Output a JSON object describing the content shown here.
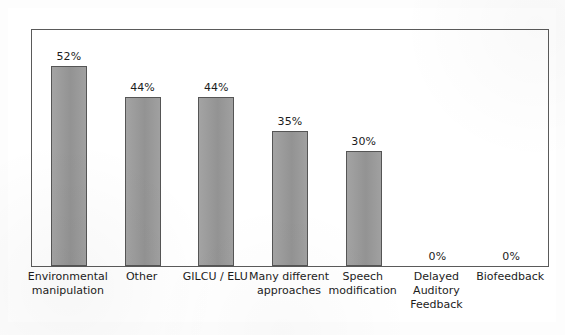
{
  "chart_data": {
    "type": "bar",
    "title": "",
    "subtitle": "",
    "xlabel": "",
    "ylabel": "",
    "ylim": [
      0,
      60
    ],
    "grid": false,
    "legend": "none",
    "orientation": "vertical",
    "value_label_format": "percent",
    "categories": [
      "Environmental manipulation",
      "Other",
      "GILCU / ELU",
      "Many different approaches",
      "Speech modification",
      "Delayed Auditory Feedback",
      "Biofeedback"
    ],
    "values": [
      52,
      44,
      44,
      35,
      30,
      0,
      0
    ],
    "value_labels": [
      "52%",
      "44%",
      "44%",
      "35%",
      "30%",
      "0%",
      "0%"
    ],
    "colors": {
      "bar_fill": "#999999",
      "bar_stroke": "#555555",
      "plot_border": "#5a5a5a",
      "outer_border": "#4a4a4a",
      "background": "#ffffff",
      "text": "#1c1c1c"
    }
  },
  "bars": [
    {
      "label_line1": "Environmental",
      "label_line2": "manipulation",
      "value_label": "52%",
      "value": 52
    },
    {
      "label_line1": "Other",
      "label_line2": "",
      "value_label": "44%",
      "value": 44
    },
    {
      "label_line1": "GILCU / ELU",
      "label_line2": "",
      "value_label": "44%",
      "value": 44
    },
    {
      "label_line1": "Many different",
      "label_line2": "approaches",
      "value_label": "35%",
      "value": 35
    },
    {
      "label_line1": "Speech",
      "label_line2": "modification",
      "value_label": "30%",
      "value": 30
    },
    {
      "label_line1": "Delayed",
      "label_line2": "Auditory",
      "label_line3": "Feedback",
      "value_label": "0%",
      "value": 0
    },
    {
      "label_line1": "Biofeedback",
      "label_line2": "",
      "value_label": "0%",
      "value": 0
    }
  ]
}
